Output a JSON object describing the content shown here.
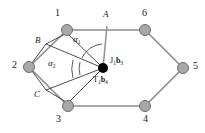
{
  "figure": {
    "background_color": "#ffffff",
    "edge_color": "#8c8c8c",
    "link_color": "#3a3a3a",
    "node_fill": "#a8a8a8",
    "node_stroke": "#6e6e6e",
    "joint_fill": "#000000",
    "arc_color": "#4a4a4a"
  },
  "nodes": [
    {
      "id": "n1",
      "label": "1",
      "cx": 67,
      "cy": 30,
      "r": 5.5,
      "label_x": 55,
      "label_y": 8
    },
    {
      "id": "n2",
      "label": "2",
      "cx": 29,
      "cy": 67,
      "r": 5.5,
      "label_x": 12,
      "label_y": 60
    },
    {
      "id": "n3",
      "label": "3",
      "cx": 68,
      "cy": 106,
      "r": 5.5,
      "label_x": 56,
      "label_y": 114
    },
    {
      "id": "n4",
      "label": "4",
      "cx": 145,
      "cy": 106,
      "r": 5.5,
      "label_x": 143,
      "label_y": 114
    },
    {
      "id": "n5",
      "label": "5",
      "cx": 183,
      "cy": 68,
      "r": 5.5,
      "label_x": 193,
      "label_y": 61
    },
    {
      "id": "n6",
      "label": "6",
      "cx": 145,
      "cy": 30,
      "r": 5.5,
      "label_x": 142,
      "label_y": 8
    }
  ],
  "points": [
    {
      "id": "A",
      "label": "A",
      "x": 107,
      "y": 30,
      "label_x": 103,
      "label_y": 10
    },
    {
      "id": "B",
      "label": "B",
      "x": 46,
      "y": 44,
      "label_x": 35,
      "label_y": 36
    },
    {
      "id": "C",
      "label": "C",
      "x": 46,
      "y": 90,
      "label_x": 34,
      "label_y": 90
    }
  ],
  "joint": {
    "cx": 103,
    "cy": 68,
    "r": 5,
    "top_label": "J",
    "top_label_sub": "1",
    "top_label_vec": "b",
    "top_label_vec_sub": "3",
    "top_label_x": 110,
    "top_label_y": 57,
    "bottom_label": "T",
    "bottom_label_sub": "1",
    "bottom_label_vec": "b",
    "bottom_label_vec_sub": "4",
    "bottom_label_x": 93,
    "bottom_label_y": 76
  },
  "angles": [
    {
      "id": "alpha1",
      "symbol": "α",
      "sub": "1",
      "label_x": 73,
      "label_y": 35
    },
    {
      "id": "alpha2",
      "symbol": "α",
      "sub": "2",
      "label_x": 48,
      "label_y": 59
    }
  ],
  "hexagon_edges": [
    {
      "from": "n1",
      "to": "n6"
    },
    {
      "from": "n6",
      "to": "n5"
    },
    {
      "from": "n5",
      "to": "n4"
    },
    {
      "from": "n4",
      "to": "n3"
    },
    {
      "from": "n3",
      "to": "n2"
    },
    {
      "from": "n2",
      "to": "n1"
    }
  ],
  "linkage_edges": [
    {
      "from": "A",
      "to": "joint",
      "orientation": "vertical"
    },
    {
      "from": "n1",
      "to": "joint",
      "orientation": "diagonal"
    },
    {
      "from": "B",
      "to": "joint",
      "orientation": "diagonal"
    },
    {
      "from": "C",
      "to": "joint",
      "orientation": "diagonal"
    },
    {
      "from": "n3",
      "to": "joint",
      "orientation": "diagonal"
    }
  ]
}
